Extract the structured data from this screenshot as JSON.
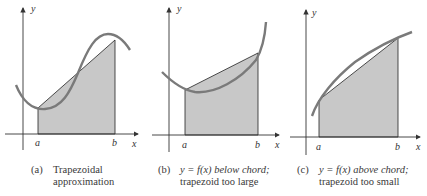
{
  "figure": {
    "colors": {
      "fill": "#c8c8c8",
      "curve": "#7a7a7a",
      "axis": "#333333",
      "chord": "#222222",
      "text": "#3a3a3a"
    },
    "panels": [
      {
        "id": "a",
        "axis_labels": {
          "x": "x",
          "y": "y"
        },
        "point_labels": {
          "a": "a",
          "b": "b"
        },
        "caption_tag": "(a)",
        "caption_line1": "Trapezoidal",
        "caption_line2": "approximation"
      },
      {
        "id": "b",
        "axis_labels": {
          "x": "x",
          "y": "y"
        },
        "point_labels": {
          "a": "a",
          "b": "b"
        },
        "caption_tag": "(b)",
        "caption_line1": "y = f(x)  below chord;",
        "caption_line2": "trapezoid too large"
      },
      {
        "id": "c",
        "axis_labels": {
          "x": "x",
          "y": "y"
        },
        "point_labels": {
          "a": "a",
          "b": "b"
        },
        "caption_tag": "(c)",
        "caption_line1": "y = f(x)  above chord;",
        "caption_line2": "trapezoid too small"
      }
    ]
  }
}
